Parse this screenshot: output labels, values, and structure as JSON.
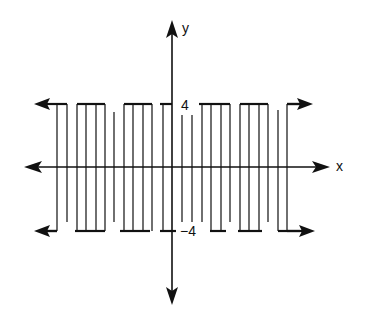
{
  "chart_data": {
    "type": "line",
    "title": "",
    "xlabel": "x",
    "ylabel": "y",
    "y_ticks": [
      {
        "value": 4,
        "label": "4"
      },
      {
        "value": -4,
        "label": "−4"
      }
    ],
    "grid": false,
    "legend": null,
    "levels": {
      "top": 4,
      "bottom": -4
    },
    "colors": {
      "ink": "#111111",
      "background": "#ffffff"
    }
  },
  "axes": {
    "x_label": "x",
    "y_label": "y",
    "tick_top_label": "4",
    "tick_bottom_label": "−4"
  },
  "geometry": {
    "origin": {
      "x": 172,
      "y": 167
    },
    "y_top": 104,
    "y_bottom": 231,
    "verticals": [
      {
        "x": 57,
        "top": 104,
        "bottom": 231
      },
      {
        "x": 67,
        "top": 104,
        "bottom": 222
      },
      {
        "x": 77,
        "top": 104,
        "bottom": 231
      },
      {
        "x": 86,
        "top": 104,
        "bottom": 231
      },
      {
        "x": 96,
        "top": 104,
        "bottom": 231
      },
      {
        "x": 105,
        "top": 104,
        "bottom": 231
      },
      {
        "x": 114,
        "top": 112,
        "bottom": 222
      },
      {
        "x": 124,
        "top": 104,
        "bottom": 231
      },
      {
        "x": 133,
        "top": 104,
        "bottom": 231
      },
      {
        "x": 143,
        "top": 104,
        "bottom": 231
      },
      {
        "x": 152,
        "top": 104,
        "bottom": 231
      },
      {
        "x": 163,
        "top": 104,
        "bottom": 231
      },
      {
        "x": 182,
        "top": 115,
        "bottom": 222
      },
      {
        "x": 192,
        "top": 115,
        "bottom": 222
      },
      {
        "x": 202,
        "top": 104,
        "bottom": 222
      },
      {
        "x": 211,
        "top": 104,
        "bottom": 231
      },
      {
        "x": 221,
        "top": 104,
        "bottom": 231
      },
      {
        "x": 230,
        "top": 104,
        "bottom": 222
      },
      {
        "x": 240,
        "top": 104,
        "bottom": 231
      },
      {
        "x": 249,
        "top": 104,
        "bottom": 231
      },
      {
        "x": 259,
        "top": 104,
        "bottom": 231
      },
      {
        "x": 268,
        "top": 104,
        "bottom": 222
      },
      {
        "x": 278,
        "top": 110,
        "bottom": 231
      },
      {
        "x": 287,
        "top": 104,
        "bottom": 231
      }
    ],
    "top_bars": [
      [
        57,
        67
      ],
      [
        77,
        105
      ],
      [
        124,
        152
      ],
      [
        160,
        172
      ],
      [
        199,
        230
      ],
      [
        240,
        268
      ],
      [
        287,
        300
      ]
    ],
    "bottom_bars": [
      [
        46,
        57
      ],
      [
        75,
        105
      ],
      [
        120,
        150
      ],
      [
        160,
        176
      ],
      [
        210,
        226
      ],
      [
        238,
        262
      ],
      [
        278,
        300
      ]
    ]
  }
}
